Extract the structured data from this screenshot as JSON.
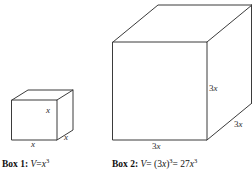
{
  "figure": {
    "background_color": "#ffffff",
    "line_color": "#3b3b3b",
    "text_color": "#111111"
  },
  "small_cube": {
    "name": "Box 1",
    "edge_labels": {
      "height": "x",
      "width": "x",
      "depth": "x"
    },
    "caption": {
      "label": "Box 1:",
      "formula_v": "V",
      "formula_eq": "=",
      "formula_base": "x",
      "formula_exp": "3"
    }
  },
  "large_cube": {
    "name": "Box 2",
    "edge_labels": {
      "height_coef": "3",
      "height_var": "x",
      "width_coef": "3",
      "width_var": "x",
      "depth_coef": "3",
      "depth_var": "x"
    },
    "caption": {
      "label": "Box 2:",
      "formula_v": "V",
      "formula_eq1": "= (3",
      "formula_var1": "x",
      "formula_close": ")",
      "formula_exp1": "3",
      "formula_eq2": "= 27",
      "formula_var2": "x",
      "formula_exp2": "3"
    }
  }
}
